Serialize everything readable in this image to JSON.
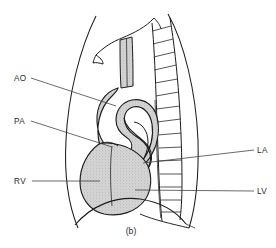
{
  "figure": {
    "caption": "(b)",
    "view": "lateral chest",
    "background_color": "#ffffff",
    "ink_color": "#1d1d1d",
    "shade_color": "#d2d2d2"
  },
  "labels": {
    "left": [
      {
        "id": "ao",
        "text": "AO",
        "meaning": "aorta",
        "x": 14,
        "y": 81,
        "leader": "M 31 78 L 116 106"
      },
      {
        "id": "pa",
        "text": "PA",
        "meaning": "pulmonary artery",
        "x": 14,
        "y": 124,
        "leader": "M 31 121 L 112 147"
      },
      {
        "id": "rv",
        "text": "RV",
        "meaning": "right ventricle",
        "x": 14,
        "y": 184,
        "leader": "M 32 181 L 100 181"
      }
    ],
    "right": [
      {
        "id": "la",
        "text": "LA",
        "meaning": "left atrium",
        "x": 257,
        "y": 153,
        "leader": "M 254 150 L 143 163"
      },
      {
        "id": "lv",
        "text": "LV",
        "meaning": "left ventricle",
        "x": 257,
        "y": 194,
        "leader": "M 254 191 L 135 190"
      }
    ]
  },
  "structures": [
    {
      "id": "chest-wall-anterior",
      "name": "anterior chest wall"
    },
    {
      "id": "chest-wall-posterior",
      "name": "posterior chest wall"
    },
    {
      "id": "vertebral-column",
      "name": "vertebral column",
      "vertebra_count": 13
    },
    {
      "id": "diaphragm",
      "name": "diaphragm"
    },
    {
      "id": "trachea",
      "name": "tracheal air column"
    },
    {
      "id": "aortic-arch",
      "name": "aortic arch"
    },
    {
      "id": "pulmonary-artery",
      "name": "pulmonary artery loop"
    },
    {
      "id": "cardiac-silhouette",
      "name": "cardiac silhouette"
    },
    {
      "id": "clavicle-scapula",
      "name": "shoulder girdle shadow"
    }
  ]
}
